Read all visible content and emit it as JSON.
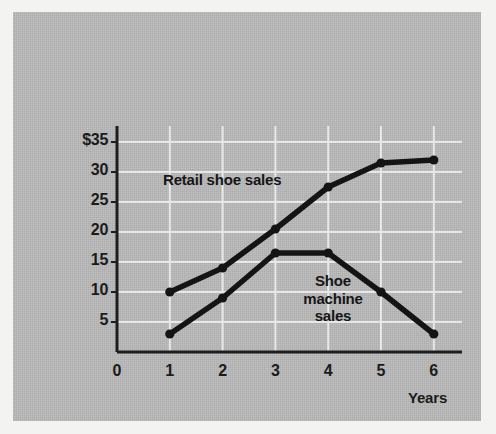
{
  "figure": {
    "background_color": "#b9b9b9",
    "ink_color": "#141414",
    "gridline_color": "#e8e8e8"
  },
  "axes": {
    "y_title": "Millions\nof\ndollars",
    "y_title_lines": [
      "Millions",
      "of",
      "dollars"
    ],
    "x_title": "Years",
    "y_tick_labels": [
      "$35",
      "30",
      "25",
      "20",
      "15",
      "10",
      "5"
    ],
    "y_tick_values": [
      35,
      30,
      25,
      20,
      15,
      10,
      5
    ],
    "x_tick_labels": [
      "0",
      "1",
      "2",
      "3",
      "4",
      "5",
      "6"
    ],
    "origin_label": "0"
  },
  "series_labels": {
    "retail": "Retail shoe sales",
    "machine": "Shoe\nmachine\nsales",
    "machine_lines": [
      "Shoe",
      "machine",
      "sales"
    ]
  },
  "chart_data": {
    "type": "line",
    "title": "",
    "subtitle": "",
    "xlabel": "Years",
    "ylabel": "Millions of dollars",
    "x": [
      1,
      2,
      3,
      4,
      5,
      6
    ],
    "xlim": [
      0,
      6
    ],
    "ylim": [
      0,
      36
    ],
    "ytick_values": [
      5,
      10,
      15,
      20,
      25,
      30,
      35
    ],
    "ytick_labels": [
      "5",
      "10",
      "15",
      "20",
      "25",
      "30",
      "$35"
    ],
    "xtick_values": [
      0,
      1,
      2,
      3,
      4,
      5,
      6
    ],
    "xtick_labels": [
      "0",
      "1",
      "2",
      "3",
      "4",
      "5",
      "6"
    ],
    "grid": true,
    "grid_color": "#e8e8e8",
    "legend_position": "inline-labels",
    "markers": "filled-circle",
    "series": [
      {
        "name": "Retail shoe sales",
        "color": "#141414",
        "values": [
          10,
          14,
          20.5,
          27.5,
          31.5,
          32
        ]
      },
      {
        "name": "Shoe machine sales",
        "color": "#141414",
        "values": [
          3,
          9,
          16.5,
          16.5,
          10,
          3
        ]
      }
    ],
    "annotations": [
      {
        "text": "Retail shoe sales",
        "x": 1.9,
        "y": 29.5
      },
      {
        "text": "Shoe machine sales",
        "x": 4.35,
        "y": 13
      }
    ]
  }
}
